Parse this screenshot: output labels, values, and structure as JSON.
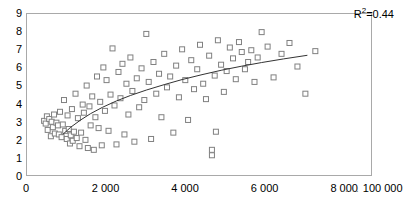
{
  "chart_data": {
    "type": "scatter",
    "title": "",
    "subtitle": "",
    "xlabel": "",
    "ylabel": "",
    "xlim": [
      0,
      8700
    ],
    "ylim": [
      0,
      9
    ],
    "grid": false,
    "legend": null,
    "annotations": [
      {
        "name": "r-squared",
        "text_prefix": "R",
        "text_sup": "2",
        "text_suffix": "=0.44",
        "value": 0.44,
        "x_pos_pct": 84,
        "y_pos_pct": 7
      }
    ],
    "x_axis": {
      "tick_values": [
        0,
        2000,
        4000,
        6000,
        8000,
        8700
      ],
      "tick_labels": [
        "0",
        "2 000",
        "4 000",
        "6 000",
        "8 000",
        "..... 100 000"
      ],
      "break_label": "..... 100 000",
      "thousands_separator": " "
    },
    "y_axis": {
      "tick_values": [
        0,
        1,
        2,
        3,
        4,
        5,
        6,
        7,
        8,
        9
      ],
      "tick_labels": [
        "0",
        "1",
        "2",
        "3",
        "4",
        "5",
        "6",
        "7",
        "8",
        "9"
      ]
    },
    "marker": {
      "shape": "open-square",
      "size_px": 5,
      "edge_color": "#808080",
      "fill_color": "#ffffff",
      "edge_width": 1
    },
    "trendline": {
      "name": "logarithmic-fit",
      "color": "#333333",
      "width": 1,
      "style": "solid",
      "x_start": 900,
      "x_end": 7050,
      "points": [
        [
          900,
          2.35
        ],
        [
          1100,
          2.75
        ],
        [
          1350,
          3.15
        ],
        [
          1600,
          3.5
        ],
        [
          1900,
          3.85
        ],
        [
          2250,
          4.2
        ],
        [
          2600,
          4.5
        ],
        [
          3000,
          4.8
        ],
        [
          3450,
          5.1
        ],
        [
          3900,
          5.38
        ],
        [
          4400,
          5.65
        ],
        [
          4900,
          5.9
        ],
        [
          5400,
          6.12
        ],
        [
          5900,
          6.32
        ],
        [
          6450,
          6.52
        ],
        [
          7050,
          6.72
        ]
      ]
    },
    "points": [
      [
        430,
        3.1
      ],
      [
        470,
        2.95
      ],
      [
        500,
        3.35
      ],
      [
        520,
        2.6
      ],
      [
        560,
        3.2
      ],
      [
        600,
        2.25
      ],
      [
        620,
        3.05
      ],
      [
        650,
        2.75
      ],
      [
        680,
        3.45
      ],
      [
        700,
        2.4
      ],
      [
        740,
        3.0
      ],
      [
        780,
        2.85
      ],
      [
        800,
        2.35
      ],
      [
        830,
        3.6
      ],
      [
        870,
        2.2
      ],
      [
        900,
        2.9
      ],
      [
        930,
        4.25
      ],
      [
        960,
        2.55
      ],
      [
        1000,
        2.1
      ],
      [
        1020,
        3.4
      ],
      [
        1050,
        2.65
      ],
      [
        1080,
        1.85
      ],
      [
        1100,
        2.3
      ],
      [
        1130,
        3.75
      ],
      [
        1150,
        2.0
      ],
      [
        1180,
        2.5
      ],
      [
        1220,
        4.6
      ],
      [
        1250,
        2.15
      ],
      [
        1280,
        3.25
      ],
      [
        1320,
        1.7
      ],
      [
        1360,
        2.45
      ],
      [
        1400,
        4.0
      ],
      [
        1430,
        3.55
      ],
      [
        1470,
        2.05
      ],
      [
        1500,
        5.05
      ],
      [
        1530,
        1.6
      ],
      [
        1570,
        3.9
      ],
      [
        1600,
        2.85
      ],
      [
        1640,
        4.45
      ],
      [
        1680,
        1.5
      ],
      [
        1720,
        3.3
      ],
      [
        1760,
        5.55
      ],
      [
        1800,
        2.7
      ],
      [
        1840,
        4.15
      ],
      [
        1880,
        1.75
      ],
      [
        1920,
        6.05
      ],
      [
        1960,
        3.65
      ],
      [
        2000,
        5.35
      ],
      [
        2050,
        2.55
      ],
      [
        2100,
        4.55
      ],
      [
        2150,
        7.1
      ],
      [
        2200,
        3.95
      ],
      [
        2250,
        1.8
      ],
      [
        2300,
        5.8
      ],
      [
        2350,
        4.35
      ],
      [
        2400,
        6.25
      ],
      [
        2450,
        2.35
      ],
      [
        2500,
        5.15
      ],
      [
        2550,
        3.45
      ],
      [
        2600,
        6.6
      ],
      [
        2650,
        4.75
      ],
      [
        2700,
        1.95
      ],
      [
        2760,
        5.45
      ],
      [
        2820,
        3.85
      ],
      [
        2880,
        6.0
      ],
      [
        2950,
        4.25
      ],
      [
        3000,
        7.9
      ],
      [
        3060,
        5.25
      ],
      [
        3120,
        2.1
      ],
      [
        3180,
        6.35
      ],
      [
        3250,
        4.6
      ],
      [
        3320,
        5.7
      ],
      [
        3380,
        3.3
      ],
      [
        3450,
        6.8
      ],
      [
        3520,
        4.95
      ],
      [
        3600,
        5.55
      ],
      [
        3680,
        2.45
      ],
      [
        3750,
        6.15
      ],
      [
        3820,
        4.4
      ],
      [
        3900,
        7.05
      ],
      [
        3980,
        5.35
      ],
      [
        4050,
        3.15
      ],
      [
        4130,
        6.45
      ],
      [
        4200,
        4.85
      ],
      [
        4280,
        5.95
      ],
      [
        4350,
        7.3
      ],
      [
        4430,
        5.15
      ],
      [
        4500,
        4.3
      ],
      [
        4580,
        6.7
      ],
      [
        4650,
        1.5
      ],
      [
        4650,
        1.2
      ],
      [
        4720,
        5.6
      ],
      [
        4800,
        7.55
      ],
      [
        4880,
        6.2
      ],
      [
        4950,
        4.7
      ],
      [
        5020,
        5.85
      ],
      [
        5100,
        7.15
      ],
      [
        5180,
        6.55
      ],
      [
        5250,
        5.4
      ],
      [
        5330,
        7.45
      ],
      [
        5400,
        6.9
      ],
      [
        5480,
        5.95
      ],
      [
        5560,
        6.35
      ],
      [
        5640,
        7.0
      ],
      [
        5720,
        5.25
      ],
      [
        5800,
        6.6
      ],
      [
        5900,
        8.0
      ],
      [
        6050,
        7.2
      ],
      [
        6200,
        5.5
      ],
      [
        6400,
        6.8
      ],
      [
        6600,
        7.4
      ],
      [
        6800,
        6.1
      ],
      [
        7000,
        4.6
      ],
      [
        7250,
        6.95
      ],
      [
        4750,
        2.5
      ]
    ]
  }
}
